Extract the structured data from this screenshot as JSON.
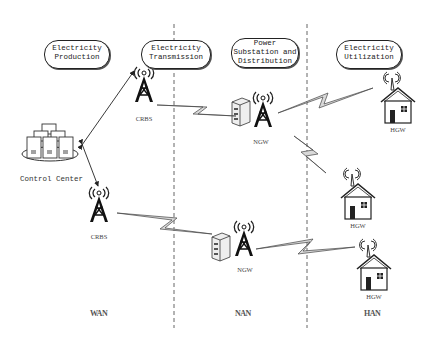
{
  "domains": [
    {
      "label_lines": [
        "Electricity",
        "Production"
      ]
    },
    {
      "label_lines": [
        "Electricity",
        "Transmission"
      ]
    },
    {
      "label_lines": [
        "Power",
        "Substation and",
        "Distribution"
      ]
    },
    {
      "label_lines": [
        "Electricity",
        "Utilization"
      ]
    }
  ],
  "nodes": {
    "control_center": "Control Center",
    "crbs_top": "CRBS",
    "crbs_bottom": "CRBS",
    "ngw_top": "NGW",
    "ngw_bottom": "NGW",
    "hgw_1": "HGW",
    "hgw_2": "HGW",
    "hgw_3": "HGW"
  },
  "zones": {
    "wan": "WAN",
    "nan": "NAN",
    "han": "HAN"
  },
  "colors": {
    "line": "#222222",
    "divider": "#666666",
    "bolt_fill": "#d9d9d9"
  }
}
